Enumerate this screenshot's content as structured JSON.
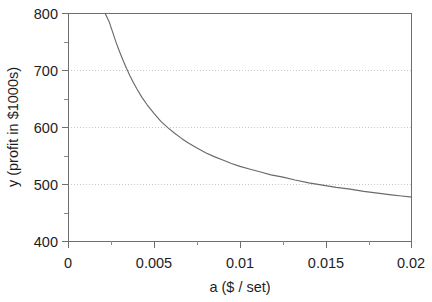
{
  "chart_data": {
    "type": "line",
    "title": "",
    "xlabel": "a ($ / set)",
    "ylabel": "y (profit in $1000s)",
    "xlim": [
      0,
      0.02
    ],
    "ylim": [
      400,
      800
    ],
    "grid": "horizontal-dotted",
    "legend": "none",
    "x_ticks": [
      0,
      0.005,
      0.01,
      0.015,
      0.02
    ],
    "x_tick_labels": [
      "0",
      "0.005",
      "0.01",
      "0.015",
      "0.02"
    ],
    "x_minor_ticks": [
      0.0025,
      0.0075,
      0.0125,
      0.0175
    ],
    "y_ticks": [
      400,
      500,
      600,
      700,
      800
    ],
    "y_tick_labels": [
      "400",
      "500",
      "600",
      "700",
      "800"
    ],
    "y_minor_ticks": [
      450,
      550,
      650,
      750
    ],
    "gridline_values": [
      500,
      600,
      700
    ],
    "curve_color": "#6a6a6a",
    "axis_color": "#6e6e6e",
    "grid_color": "#c9c9c9",
    "series": [
      {
        "name": "profit curve",
        "x": [
          0.00215,
          0.0024,
          0.0026,
          0.0028,
          0.003,
          0.0032,
          0.0034,
          0.0036,
          0.0038,
          0.004,
          0.0043,
          0.0046,
          0.005,
          0.0054,
          0.0058,
          0.0062,
          0.0066,
          0.007,
          0.0075,
          0.008,
          0.0085,
          0.009,
          0.0095,
          0.01,
          0.0106,
          0.0112,
          0.0118,
          0.0125,
          0.0132,
          0.014,
          0.0148,
          0.0156,
          0.0164,
          0.0172,
          0.018,
          0.0188,
          0.0194,
          0.02
        ],
        "y": [
          800,
          784,
          766,
          748,
          732,
          717,
          703,
          690,
          678,
          667,
          652,
          639,
          624,
          610,
          599,
          589,
          580,
          572,
          563,
          555,
          548,
          542,
          536,
          531,
          526,
          521,
          516,
          512,
          507,
          502,
          498,
          494,
          491,
          487,
          484,
          481,
          479,
          477
        ]
      }
    ],
    "annotations": []
  }
}
